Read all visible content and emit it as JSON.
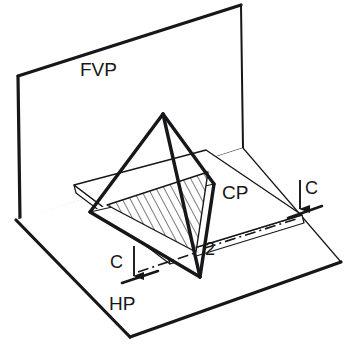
{
  "figure": {
    "background_color": "#ffffff",
    "line_color": "#17171a",
    "labels": {
      "frontal_plane": "FVP",
      "horizontal_plane": "HP",
      "cutting_plane": "CP",
      "section_arrow_left": "C",
      "section_arrow_right": "C",
      "vertex_2": "2"
    },
    "label_positions": {
      "frontal_plane": {
        "x": 80,
        "y": 76,
        "font_size": 19
      },
      "horizontal_plane": {
        "x": 109,
        "y": 310,
        "font_size": 19
      },
      "cutting_plane": {
        "x": 222,
        "y": 199,
        "font_size": 19
      },
      "section_arrow_left": {
        "x": 110,
        "y": 268,
        "font_size": 18
      },
      "section_arrow_right": {
        "x": 305,
        "y": 194,
        "font_size": 18
      },
      "vertex_2": {
        "x": 205,
        "y": 255,
        "font_size": 18
      }
    },
    "geometry": {
      "fvp_outline": "18,76 241,5 243,148 20,220",
      "fvp_visible_edges": "18,76 241,5 243,148",
      "hp_outline": "16,220 243,148 341,262 130,337",
      "hp_visible_edges": "16,220 130,337 341,262",
      "cp_top_face": "74,185 206,150 302,215 168,256",
      "cp_thickness_offset": {
        "dx": 2,
        "dy": 8
      },
      "tetra_apex": {
        "x": 163,
        "y": 114
      },
      "tetra_left": {
        "x": 90,
        "y": 212
      },
      "tetra_bottom": {
        "x": 200,
        "y": 277
      },
      "tetra_right": {
        "x": 214,
        "y": 184
      },
      "section_triangle": "107,205 208,172 196,252",
      "hatch_angle_deg": 28,
      "hatch_spacing": 7,
      "chain_line": "205,248 296,219",
      "arrow_left": {
        "x": 134,
        "y_top": 246,
        "y_tip": 282
      },
      "arrow_right": {
        "x": 300,
        "y_top": 180,
        "y_tip": 215
      }
    }
  }
}
